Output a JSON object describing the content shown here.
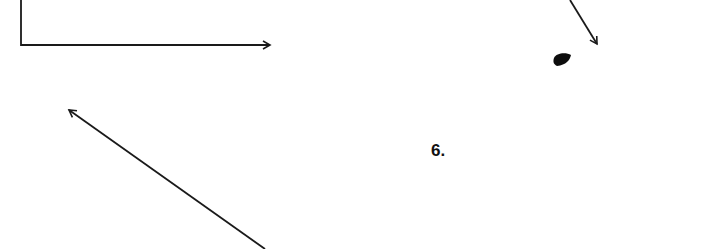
{
  "diagram": {
    "background": "#ffffff",
    "stroke_color": "#1a1a1a",
    "elements": [
      {
        "type": "polyline-arrow",
        "name": "corner-arrow-right",
        "points": [
          [
            21,
            0
          ],
          [
            21,
            45
          ],
          [
            270,
            45
          ]
        ]
      },
      {
        "type": "arrow",
        "name": "diagonal-arrow-down-right",
        "from": [
          570,
          0
        ],
        "to": [
          597,
          44
        ]
      },
      {
        "type": "blob",
        "name": "ink-dot",
        "center": [
          562,
          60
        ]
      },
      {
        "type": "arrow",
        "name": "diagonal-arrow-up-left",
        "from": [
          265,
          249
        ],
        "to": [
          69,
          110
        ]
      }
    ],
    "label": "6."
  }
}
